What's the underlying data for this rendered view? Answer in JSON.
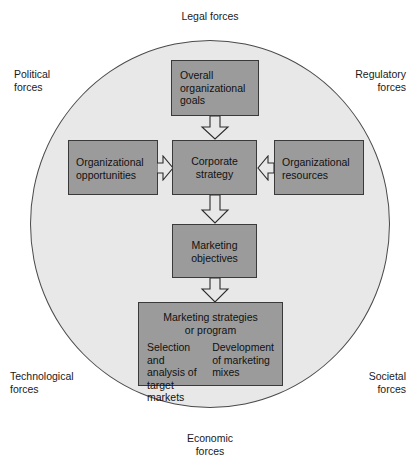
{
  "diagram": {
    "title_implicit": "Marketing environment and corporate strategy diagram",
    "environment": {
      "shape": "circle",
      "fill_color": "#e8e8e8",
      "border_color": "#4a4a4a"
    },
    "box_color": "#9b9b9b",
    "box_border_color": "#3a3a3a",
    "forces": {
      "top": "Legal forces",
      "top_left": "Political\nforces",
      "top_right": "Regulatory\nforces",
      "bottom_left": "Technological\nforces",
      "bottom_right": "Societal\nforces",
      "bottom": "Economic\nforces"
    },
    "nodes": {
      "overall_goals": "Overall\norganizational\ngoals",
      "organizational_opportunities": "Organizational\nopportunities",
      "corporate_strategy": "Corporate\nstrategy",
      "organizational_resources": "Organizational\nresources",
      "marketing_objectives": "Marketing\nobjectives",
      "marketing_strategies_title": "Marketing strategies\nor program",
      "marketing_strategies_sub_left": "Selection and\nanalysis of\ntarget markets",
      "marketing_strategies_sub_right": "Development\nof marketing\nmixes"
    },
    "arrows": [
      {
        "name": "goals-to-strategy",
        "direction": "down",
        "from": "overall_goals",
        "to": "corporate_strategy"
      },
      {
        "name": "opportunities-to-strategy",
        "direction": "right",
        "from": "organizational_opportunities",
        "to": "corporate_strategy"
      },
      {
        "name": "resources-to-strategy",
        "direction": "left",
        "from": "organizational_resources",
        "to": "corporate_strategy"
      },
      {
        "name": "strategy-to-objectives",
        "direction": "down",
        "from": "corporate_strategy",
        "to": "marketing_objectives"
      },
      {
        "name": "objectives-to-strategies",
        "direction": "down",
        "from": "marketing_objectives",
        "to": "marketing_strategies_title"
      }
    ]
  }
}
